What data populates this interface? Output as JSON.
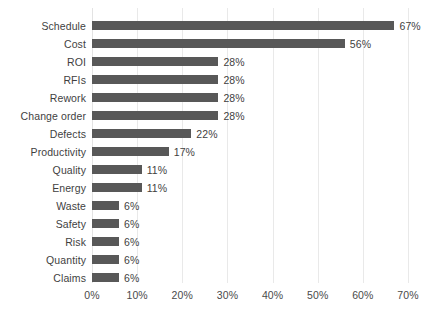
{
  "chart_data": {
    "type": "bar",
    "orientation": "horizontal",
    "title": "",
    "subtitle": "",
    "xlabel": "",
    "ylabel": "",
    "xlim": [
      0,
      70
    ],
    "xticks": [
      0,
      10,
      20,
      30,
      40,
      50,
      60,
      70
    ],
    "xtick_labels": [
      "0%",
      "10%",
      "20%",
      "30%",
      "40%",
      "50%",
      "60%",
      "70%"
    ],
    "grid": "vertical",
    "legend": "none",
    "bar_color": "#585858",
    "gridline_color": "#e9e9e9",
    "label_color": "#3f3f3f",
    "background": "#ffffff",
    "categories": [
      "Schedule",
      "Cost",
      "ROI",
      "RFIs",
      "Rework",
      "Change order",
      "Defects",
      "Productivity",
      "Quality",
      "Energy",
      "Waste",
      "Safety",
      "Risk",
      "Quantity",
      "Claims"
    ],
    "values": [
      67,
      56,
      28,
      28,
      28,
      28,
      22,
      17,
      11,
      11,
      6,
      6,
      6,
      6,
      6
    ],
    "data_labels": [
      "67%",
      "56%",
      "28%",
      "28%",
      "28%",
      "28%",
      "22%",
      "17%",
      "11%",
      "11%",
      "6%",
      "6%",
      "6%",
      "6%",
      "6%"
    ]
  }
}
